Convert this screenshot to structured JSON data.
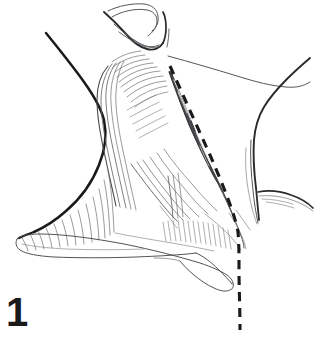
{
  "figure": {
    "number": "1",
    "caption_text": "1",
    "kind": "anatomical-line-drawing",
    "background_color": "#ffffff",
    "ink_color": "#1a1a1a",
    "hairline_color": "#6e6e72",
    "midline_color": "#3c3c40",
    "vessel_fill": "#4a4a4e"
  },
  "structures": [
    {
      "name": "mandible-chin-outline",
      "label": "Mandible / chin outline",
      "stroke": "#2a2a2e",
      "width": 2.0
    },
    {
      "name": "neck-anterior-contour",
      "label": "Anterior neck contour",
      "stroke": "#1a1a1a",
      "width": 2.6
    },
    {
      "name": "sternocleidomastoid-muscle",
      "label": "Sternocleidomastoid muscle",
      "stroke": "#5a5a5e",
      "width": 0.7
    },
    {
      "name": "external-jugular-vein",
      "label": "External jugular vein",
      "stroke": "#2a2a2e",
      "fill": "#4a4a4e",
      "width": 1.0
    },
    {
      "name": "clavicle-bone",
      "label": "Clavicle",
      "stroke": "#4a4a4e",
      "width": 0.9
    },
    {
      "name": "trapezius-shoulder-contour",
      "label": "Trapezius / shoulder contour",
      "stroke": "#2a2a2e",
      "width": 1.8
    },
    {
      "name": "platysma-fiber-striations",
      "label": "Platysma fiber striations",
      "stroke": "#6e6e72",
      "width": 0.6
    },
    {
      "name": "incision-reference-line",
      "label": "Dashed incision / reference line",
      "stroke": "#1a1a1a",
      "width": 3.2,
      "dash": "9 7"
    }
  ]
}
